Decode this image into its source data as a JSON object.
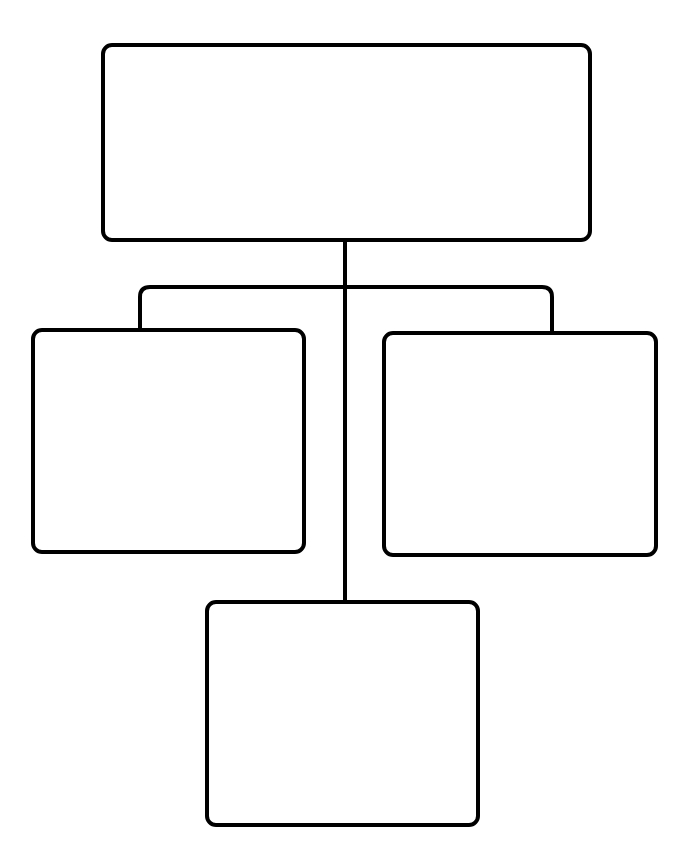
{
  "diagram": {
    "type": "hierarchy-chart",
    "stroke_color": "#000000",
    "background_color": "#ffffff",
    "nodes": [
      {
        "id": "top",
        "label": "",
        "level": 0
      },
      {
        "id": "left",
        "label": "",
        "level": 1
      },
      {
        "id": "right",
        "label": "",
        "level": 1
      },
      {
        "id": "bottom",
        "label": "",
        "level": 2
      }
    ],
    "edges": [
      {
        "from": "top",
        "to": "left"
      },
      {
        "from": "top",
        "to": "right"
      },
      {
        "from": "top",
        "to": "bottom"
      }
    ]
  }
}
